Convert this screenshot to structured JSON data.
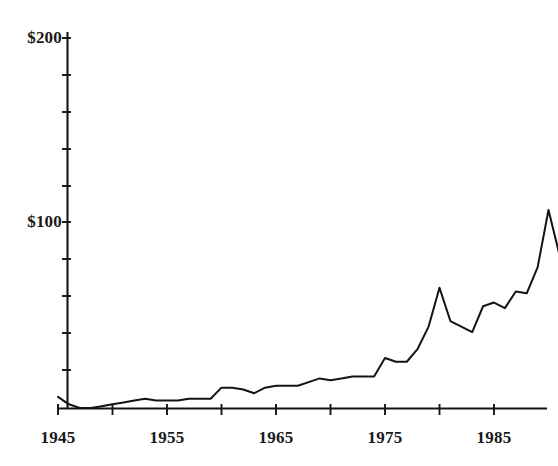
{
  "chart_data": {
    "type": "line",
    "title": "",
    "subtitle": "",
    "xlabel": "",
    "ylabel": "",
    "xlim": [
      1945,
      1991
    ],
    "ylim": [
      0,
      200
    ],
    "grid": false,
    "legend": null,
    "y_tick_labels": [
      "$100",
      "$200"
    ],
    "y_tick_values": [
      100,
      200
    ],
    "y_minor_tick_values": [
      20,
      40,
      60,
      80,
      120,
      140,
      160,
      180
    ],
    "x_tick_labels": [
      "1945",
      "1955",
      "1965",
      "1975",
      "1985"
    ],
    "x_tick_values": [
      1945,
      1955,
      1965,
      1975,
      1985
    ],
    "x_minor_tick_values": [
      1950,
      1960,
      1970,
      1980,
      1990
    ],
    "line_color": "#141414",
    "series": [
      {
        "name": "value",
        "x": [
          1945,
          1946,
          1947,
          1948,
          1949,
          1950,
          1951,
          1952,
          1953,
          1954,
          1955,
          1956,
          1957,
          1958,
          1959,
          1960,
          1961,
          1962,
          1963,
          1964,
          1965,
          1966,
          1967,
          1968,
          1969,
          1970,
          1971,
          1972,
          1973,
          1974,
          1975,
          1976,
          1977,
          1978,
          1979,
          1980,
          1981,
          1982,
          1983,
          1984,
          1985,
          1986,
          1987,
          1988,
          1989,
          1990,
          1991
        ],
        "values": [
          6,
          2,
          0,
          0,
          1,
          2,
          3,
          4,
          5,
          4,
          4,
          4,
          5,
          5,
          5,
          11,
          11,
          10,
          8,
          11,
          12,
          12,
          12,
          14,
          16,
          15,
          16,
          17,
          17,
          17,
          27,
          25,
          25,
          32,
          44,
          65,
          47,
          44,
          41,
          55,
          57,
          54,
          63,
          62,
          76,
          107,
          83
        ]
      }
    ]
  },
  "axes": {
    "y_axis_name": "dollar-axis",
    "x_axis_name": "year-axis"
  }
}
